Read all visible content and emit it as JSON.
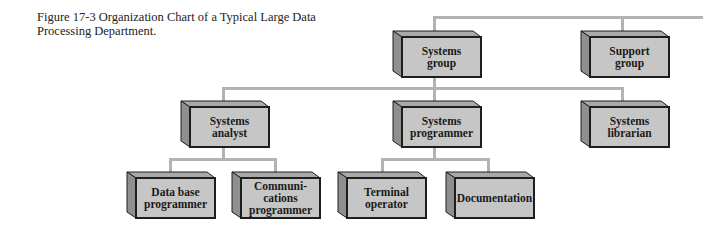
{
  "figure": {
    "caption": "Figure 17-3 Organization Chart of a Typical Large Data Processing Department."
  },
  "colors": {
    "front_face": "#c6c6c6",
    "top_face": "#a9a9a9",
    "side_face": "#8f8f8f",
    "outline": "#1e1e1e",
    "connector": "#b3b3b3"
  },
  "chart": {
    "level1": [
      {
        "label": "Systems\ngroup"
      },
      {
        "label": "Support\ngroup"
      }
    ],
    "level2": [
      {
        "label": "Systems\nanalyst"
      },
      {
        "label": "Systems\nprogrammer"
      },
      {
        "label": "Systems\nlibrarian"
      }
    ],
    "level3": [
      {
        "label": "Data base\nprogrammer"
      },
      {
        "label": "Communi-\ncations\nprogrammer"
      },
      {
        "label": "Terminal\noperator"
      },
      {
        "label": "Documentation"
      }
    ]
  }
}
